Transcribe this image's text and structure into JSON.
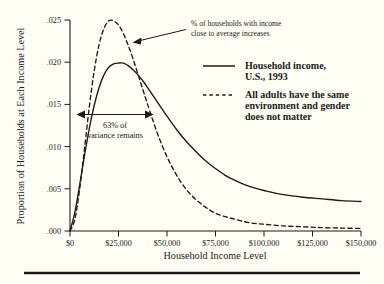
{
  "chart_data": {
    "type": "line",
    "title": "",
    "subtitle": "",
    "xlabel": "Household Income Level",
    "ylabel": "Proportion of Households at Each Income Level",
    "xlim": [
      0,
      150000
    ],
    "ylim": [
      0,
      0.025
    ],
    "grid": false,
    "legend_position": "top-right",
    "xticks": [
      0,
      25000,
      50000,
      75000,
      100000,
      125000,
      150000
    ],
    "xtick_labels": [
      "$0",
      "$25,000",
      "$50,000",
      "$75,000",
      "$100,000",
      "$125,000",
      "$150,000"
    ],
    "yticks": [
      0.0,
      0.005,
      0.01,
      0.015,
      0.02,
      0.025
    ],
    "ytick_labels": [
      ".000",
      ".005",
      ".010",
      ".015",
      ".020",
      ".025"
    ],
    "x": [
      0,
      2500,
      5000,
      7500,
      10000,
      12500,
      15000,
      17500,
      20000,
      22500,
      25000,
      27500,
      30000,
      32500,
      35000,
      37500,
      40000,
      45000,
      50000,
      55000,
      60000,
      65000,
      70000,
      75000,
      80000,
      85000,
      90000,
      95000,
      100000,
      110000,
      120000,
      130000,
      140000,
      150000
    ],
    "series": [
      {
        "name": "Household income, U.S., 1993",
        "style": "solid",
        "color": "#1a1a18",
        "values": [
          0.0,
          0.0022,
          0.0055,
          0.009,
          0.0122,
          0.0149,
          0.017,
          0.0185,
          0.0194,
          0.0198,
          0.0199,
          0.0199,
          0.0196,
          0.0191,
          0.0185,
          0.0178,
          0.017,
          0.0153,
          0.0136,
          0.012,
          0.0106,
          0.0094,
          0.0083,
          0.0074,
          0.0066,
          0.006,
          0.0055,
          0.0051,
          0.0048,
          0.0043,
          0.004,
          0.0038,
          0.0036,
          0.0035
        ]
      },
      {
        "name": "All adults have the same environment and gender does not matter",
        "style": "dashed",
        "color": "#1a1a18",
        "values": [
          0.0,
          0.0014,
          0.005,
          0.0098,
          0.0148,
          0.019,
          0.0221,
          0.024,
          0.0249,
          0.0249,
          0.0244,
          0.0234,
          0.022,
          0.0204,
          0.0186,
          0.0168,
          0.015,
          0.0116,
          0.0088,
          0.0066,
          0.0049,
          0.0037,
          0.0028,
          0.0021,
          0.0017,
          0.0014,
          0.0011,
          0.0009,
          0.0008,
          0.0006,
          0.0005,
          0.0004,
          0.00035,
          0.0003
        ]
      }
    ],
    "annotations": [
      {
        "name": "peak-callout",
        "text_lines": [
          "% of households with income",
          "close to average increases"
        ],
        "arrow_from": [
          188,
          30
        ],
        "arrow_to": [
          133,
          42
        ]
      },
      {
        "name": "variance-span",
        "text_lines": [
          "63% of",
          "variance remains"
        ],
        "arrow_left": [
          78,
          115
        ],
        "arrow_right": [
          152,
          115
        ],
        "double_headed": true
      }
    ]
  },
  "legend": {
    "items": [
      {
        "style": "solid",
        "lines": [
          "Household income,",
          "U.S., 1993"
        ]
      },
      {
        "style": "dashed",
        "lines": [
          "All adults have the same",
          "environment and gender",
          "does not matter"
        ]
      }
    ]
  },
  "axes": {
    "x_title": "Household Income Level",
    "y_title": "Proportion of Households at Each Income Level"
  }
}
